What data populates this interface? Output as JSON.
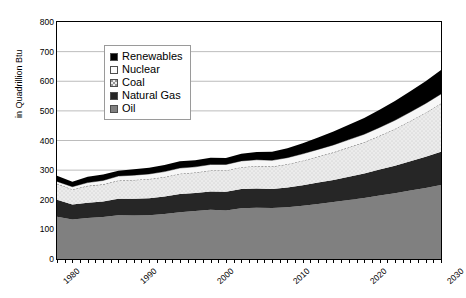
{
  "chart_data": {
    "type": "area",
    "stacked": true,
    "title": "",
    "subtitle": "",
    "xlabel": "",
    "ylabel": "in Quadrillion Btu",
    "xlim": [
      1980,
      2030
    ],
    "ylim": [
      0,
      800
    ],
    "ytick_labels": [
      "800",
      "700",
      "600",
      "500",
      "400",
      "300",
      "200",
      "100",
      "0"
    ],
    "ytick_values": [
      800,
      700,
      600,
      500,
      400,
      300,
      200,
      100,
      0
    ],
    "xtick_labels": [
      "1980",
      "1990",
      "2000",
      "2010",
      "2020",
      "2030"
    ],
    "xtick_values": [
      1980,
      1990,
      2000,
      2010,
      2020,
      2030
    ],
    "grid": "horizontal",
    "legend_position": "upper-left-inside",
    "stack_order_bottom_to_top": [
      "Oil",
      "Natural Gas",
      "Coal",
      "Nuclear",
      "Renewables"
    ],
    "x": [
      1980,
      1982,
      1984,
      1986,
      1988,
      1990,
      1992,
      1994,
      1996,
      1998,
      2000,
      2002,
      2004,
      2006,
      2008,
      2010,
      2012,
      2014,
      2016,
      2018,
      2020,
      2022,
      2024,
      2026,
      2028,
      2030
    ],
    "series": [
      {
        "name": "Oil",
        "color": "#808080",
        "values": [
          143,
          133,
          138,
          142,
          148,
          147,
          148,
          152,
          158,
          162,
          166,
          164,
          171,
          173,
          172,
          175,
          180,
          186,
          192,
          199,
          206,
          214,
          222,
          231,
          240,
          250
        ]
      },
      {
        "name": "Natural Gas",
        "color": "#262626",
        "values": [
          57,
          51,
          52,
          52,
          55,
          56,
          57,
          59,
          61,
          61,
          62,
          63,
          65,
          65,
          64,
          66,
          69,
          72,
          75,
          79,
          83,
          88,
          93,
          99,
          105,
          112
        ]
      },
      {
        "name": "Coal",
        "color": "#ebebeb",
        "values": [
          54,
          51,
          57,
          58,
          62,
          64,
          65,
          66,
          69,
          69,
          71,
          72,
          74,
          76,
          76,
          79,
          83,
          88,
          93,
          99,
          105,
          114,
          124,
          136,
          149,
          163
        ]
      },
      {
        "name": "Nuclear",
        "color": "#f7f7f7",
        "values": [
          8,
          9,
          11,
          13,
          15,
          16,
          17,
          18,
          19,
          19,
          20,
          20,
          21,
          21,
          21,
          22,
          23,
          24,
          25,
          26,
          27,
          28,
          29,
          30,
          31,
          32
        ]
      },
      {
        "name": "Renewables",
        "color": "#000000",
        "values": [
          19,
          17,
          20,
          20,
          18,
          20,
          21,
          22,
          23,
          22,
          23,
          22,
          24,
          26,
          29,
          32,
          36,
          40,
          45,
          50,
          55,
          60,
          65,
          70,
          75,
          81
        ]
      }
    ],
    "totals": [
      281,
      261,
      278,
      285,
      298,
      303,
      308,
      317,
      330,
      333,
      342,
      341,
      355,
      361,
      362,
      374,
      391,
      410,
      430,
      453,
      476,
      504,
      533,
      566,
      600,
      638
    ]
  },
  "legend": {
    "items": [
      {
        "label": "Renewables",
        "swatch": "solid-black",
        "color": "#000000"
      },
      {
        "label": "Nuclear",
        "swatch": "solid-white",
        "color": "#fbfbfb"
      },
      {
        "label": "Coal",
        "swatch": "dotted-light",
        "color": "#ececec"
      },
      {
        "label": "Natural Gas",
        "swatch": "solid-dark-gray",
        "color": "#262626"
      },
      {
        "label": "Oil",
        "swatch": "solid-mid-gray",
        "color": "#808080"
      }
    ]
  },
  "axes": {
    "y_title": "in Quadrillion Btu"
  }
}
